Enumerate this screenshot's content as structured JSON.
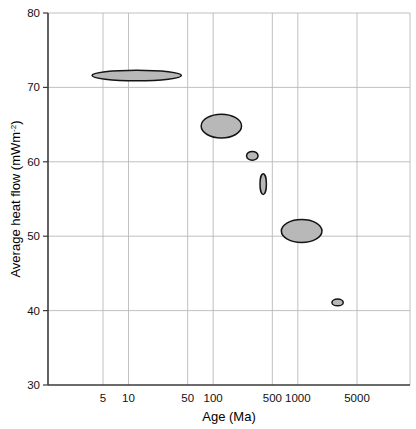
{
  "chart_data": {
    "type": "scatter",
    "title": "",
    "xlabel": "Age (Ma)",
    "ylabel": "Average heat flow (mWm⁻²)",
    "x_scale": "log",
    "y_scale": "linear",
    "xlim": [
      2.3,
      13000
    ],
    "ylim": [
      30,
      80
    ],
    "grid": true,
    "legend": "none",
    "marker_style": "filled-ellipse",
    "marker_fill": "#b8b8b8",
    "marker_stroke": "#141414",
    "x_ticks": [
      {
        "value": 5,
        "label": "5"
      },
      {
        "value": 10,
        "label": "10"
      },
      {
        "value": 50,
        "label": "50"
      },
      {
        "value": 100,
        "label": "100"
      },
      {
        "value": 500,
        "label": "500"
      },
      {
        "value": 1000,
        "label": "1000"
      },
      {
        "value": 5000,
        "label": "5000"
      }
    ],
    "y_ticks": [
      {
        "value": 80,
        "label": "80"
      },
      {
        "value": 70,
        "label": "70"
      },
      {
        "value": 60,
        "label": "60"
      },
      {
        "value": 50,
        "label": "50"
      },
      {
        "value": 40,
        "label": "40"
      },
      {
        "value": 30,
        "label": "30"
      }
    ],
    "points": [
      {
        "name": "band-1",
        "x": 12.5,
        "y": 71.6,
        "x_low": 3.7,
        "x_high": 42,
        "y_low": 70.9,
        "y_high": 72.3
      },
      {
        "name": "band-2",
        "x": 125,
        "y": 64.8,
        "x_low": 72,
        "x_high": 216,
        "y_low": 63.2,
        "y_high": 66.4
      },
      {
        "name": "band-3",
        "x": 290,
        "y": 60.8,
        "x_low": 248,
        "x_high": 339,
        "y_low": 60.2,
        "y_high": 61.4
      },
      {
        "name": "band-4",
        "x": 390,
        "y": 57.0,
        "x_low": 358,
        "x_high": 425,
        "y_low": 55.6,
        "y_high": 58.4
      },
      {
        "name": "band-5",
        "x": 1110,
        "y": 50.7,
        "x_low": 640,
        "x_high": 1930,
        "y_low": 49.1,
        "y_high": 52.2
      },
      {
        "name": "band-6",
        "x": 2950,
        "y": 41.1,
        "x_low": 2530,
        "x_high": 3440,
        "y_low": 40.7,
        "y_high": 41.6
      }
    ]
  },
  "axes": {
    "y_label_main": "Average heat flow (mWm",
    "y_label_sup": "-2",
    "y_label_close": ")",
    "x_label": "Age (Ma)"
  }
}
